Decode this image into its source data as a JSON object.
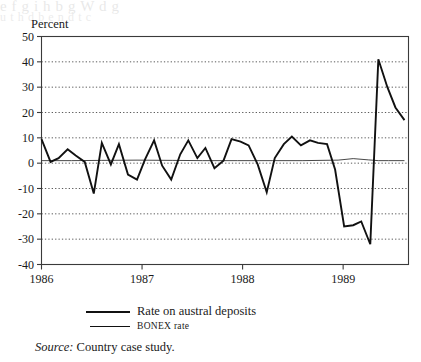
{
  "figure": {
    "ghost_text_top": "e   f        g        i      h  b  g   W       d            g",
    "ghost_text_sub": "u     t    h  d      b      e     n d   t        c"
  },
  "axis_unit_label": "Percent",
  "source": {
    "prefix": "Source:",
    "text": "Country case study."
  },
  "legend": {
    "items": [
      {
        "label": "Rate on austral deposits",
        "style": "thick"
      },
      {
        "label": "BONEX rate",
        "style": "thin",
        "smallcaps": true
      }
    ]
  },
  "chart_data": {
    "type": "line",
    "title": "",
    "xlabel": "",
    "ylabel": "Percent",
    "ylim": [
      -40,
      50
    ],
    "xlim": [
      1986.0,
      1989.65
    ],
    "yticks": [
      50,
      40,
      30,
      20,
      10,
      0,
      -10,
      -20,
      -30,
      -40
    ],
    "ytick_labels": [
      "50",
      "40",
      "30",
      "20",
      "10",
      "0",
      "-10",
      "-20",
      "-30",
      "-40"
    ],
    "xticks": [
      1986,
      1987,
      1988,
      1989
    ],
    "xtick_labels": [
      "1986",
      "1987",
      "1988",
      "1989"
    ],
    "grid": "horizontal-dotted",
    "legend_position": "below-plot",
    "series": [
      {
        "name": "Rate on austral deposits",
        "style": "thick",
        "color": "#111111",
        "x": [
          1986.0,
          1986.09,
          1986.17,
          1986.26,
          1986.34,
          1986.43,
          1986.52,
          1986.6,
          1986.69,
          1986.77,
          1986.86,
          1986.95,
          1987.03,
          1987.12,
          1987.2,
          1987.29,
          1987.38,
          1987.46,
          1987.55,
          1987.63,
          1987.72,
          1987.81,
          1987.89,
          1987.98,
          1988.06,
          1988.15,
          1988.24,
          1988.32,
          1988.41,
          1988.49,
          1988.58,
          1988.67,
          1988.75,
          1988.84,
          1988.92,
          1989.01,
          1989.1,
          1989.18,
          1989.27,
          1989.35,
          1989.44,
          1989.52,
          1989.61
        ],
        "y": [
          9.5,
          0.5,
          2.0,
          5.5,
          3.0,
          0.5,
          -12.0,
          8.0,
          -0.5,
          7.5,
          -4.5,
          -6.5,
          1.5,
          9.0,
          -1.0,
          -6.5,
          3.5,
          9.0,
          2.0,
          6.0,
          -2.0,
          1.0,
          9.5,
          8.5,
          7.0,
          -0.5,
          -11.5,
          2.0,
          7.5,
          10.5,
          7.0,
          9.0,
          8.0,
          7.5,
          -2.5,
          -25.0,
          -24.5,
          -23.0,
          -32.0,
          41.0,
          30.0,
          22.0,
          17.0
        ]
      },
      {
        "name": "BONEX rate",
        "style": "thin",
        "color": "#333333",
        "x": [
          1986.0,
          1986.3,
          1986.6,
          1986.95,
          1987.3,
          1987.6,
          1987.95,
          1988.3,
          1988.6,
          1988.95,
          1989.1,
          1989.25,
          1989.35,
          1989.45,
          1989.61
        ],
        "y": [
          1.0,
          1.0,
          1.1,
          1.2,
          1.1,
          1.0,
          1.0,
          1.0,
          1.0,
          1.2,
          1.8,
          1.3,
          1.0,
          1.0,
          1.0
        ]
      }
    ]
  }
}
